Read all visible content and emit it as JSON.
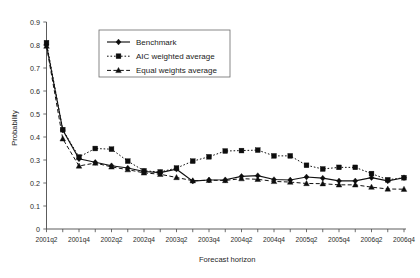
{
  "chart_data": {
    "type": "line",
    "title": "",
    "xlabel": "Forecast horizon",
    "ylabel": "Probability",
    "ylim": [
      0,
      0.9
    ],
    "ytick_step": 0.1,
    "yticks": [
      "0",
      "0.1",
      "0.2",
      "0.3",
      "0.4",
      "0.5",
      "0.6",
      "0.7",
      "0.8",
      "0.9"
    ],
    "grid": false,
    "legend_position": "top-center",
    "x": [
      "2001q2",
      "2001q3",
      "2001q4",
      "2002q1",
      "2002q2",
      "2002q3",
      "2002q4",
      "2003q1",
      "2003q2",
      "2003q3",
      "2003q4",
      "2004q1",
      "2004q2",
      "2004q3",
      "2004q4",
      "2005q1",
      "2005q2",
      "2005q3",
      "2005q4",
      "2006q1",
      "2006q2",
      "2006q3",
      "2006q4"
    ],
    "xticklabels": [
      "2001q2",
      "",
      "2001q4",
      "",
      "2002q2",
      "",
      "2002q4",
      "",
      "2003q2",
      "",
      "2003q4",
      "",
      "2004q2",
      "",
      "2004q4",
      "",
      "2005q2",
      "",
      "2005q4",
      "",
      "2006q2",
      "",
      "2006q4"
    ],
    "series": [
      {
        "name": "Benchmark",
        "marker": "diamond",
        "linestyle": "solid",
        "color": "#111111",
        "values": [
          0.8,
          0.43,
          0.305,
          0.29,
          0.275,
          0.265,
          0.25,
          0.245,
          0.26,
          0.208,
          0.213,
          0.214,
          0.229,
          0.232,
          0.215,
          0.213,
          0.226,
          0.221,
          0.209,
          0.209,
          0.223,
          0.209,
          0.223
        ]
      },
      {
        "name": "AIC weighted average",
        "marker": "square",
        "linestyle": "dotted",
        "color": "#111111",
        "values": [
          0.81,
          0.432,
          0.313,
          0.35,
          0.347,
          0.295,
          0.253,
          0.248,
          0.265,
          0.295,
          0.314,
          0.339,
          0.341,
          0.343,
          0.318,
          0.318,
          0.277,
          0.261,
          0.268,
          0.268,
          0.241,
          0.214,
          0.223
        ]
      },
      {
        "name": "Equal weights average",
        "marker": "triangle",
        "linestyle": "dashed",
        "color": "#111111",
        "values": [
          0.795,
          0.392,
          0.274,
          0.287,
          0.27,
          0.258,
          0.244,
          0.238,
          0.224,
          0.21,
          0.212,
          0.211,
          0.219,
          0.216,
          0.207,
          0.204,
          0.198,
          0.197,
          0.192,
          0.192,
          0.182,
          0.174,
          0.173
        ]
      }
    ]
  },
  "legend": {
    "items": [
      {
        "label": "Benchmark"
      },
      {
        "label": "AIC weighted average"
      },
      {
        "label": "Equal weights average"
      }
    ]
  }
}
